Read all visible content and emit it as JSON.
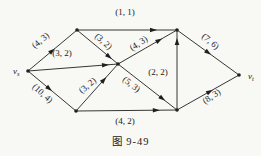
{
  "caption": "图 9-49",
  "colors": {
    "background": "#f8f8f5",
    "ink": "#1f1f1f"
  },
  "network": {
    "description": "flow-network-with-capacity-flow-labels",
    "nodes": [
      {
        "id": "vs",
        "x": 28,
        "y": 71,
        "label": "v",
        "sub": "s",
        "label_dx": -15,
        "label_dy": 1
      },
      {
        "id": "a",
        "x": 77,
        "y": 30
      },
      {
        "id": "b",
        "x": 177,
        "y": 30
      },
      {
        "id": "m",
        "x": 118,
        "y": 64
      },
      {
        "id": "c",
        "x": 76,
        "y": 111
      },
      {
        "id": "d",
        "x": 177,
        "y": 110
      },
      {
        "id": "vt",
        "x": 239,
        "y": 75,
        "label": "v",
        "sub": "t",
        "label_dx": 9,
        "label_dy": 2
      }
    ],
    "edges": [
      {
        "from": "vs",
        "to": "a",
        "label": "(4, 3)",
        "arrow_t": 0.55,
        "lx": 41,
        "ly": 41,
        "la": -40
      },
      {
        "from": "a",
        "to": "b",
        "label": "(1, 1)",
        "arrow_t": 0.8,
        "lx": 125,
        "ly": 13,
        "la": 0
      },
      {
        "from": "a",
        "to": "m",
        "label": "(3, 2)",
        "arrow_t": 0.85,
        "lx": 103,
        "ly": 42,
        "la": 42
      },
      {
        "from": "vs",
        "to": "m",
        "label": "(3, 2)",
        "arrow_t": 0.9,
        "lx": 62,
        "ly": 54,
        "la": 0
      },
      {
        "from": "vs",
        "to": "c",
        "label": "(10, 4)",
        "arrow_t": 0.5,
        "lx": 42,
        "ly": 94,
        "la": 42
      },
      {
        "from": "c",
        "to": "m",
        "label": "(3, 2)",
        "arrow_t": 0.72,
        "lx": 88,
        "ly": 86,
        "la": -40
      },
      {
        "from": "m",
        "to": "b",
        "label": "(4, 3)",
        "arrow_t": 0.75,
        "lx": 139,
        "ly": 44,
        "la": -33
      },
      {
        "from": "m",
        "to": "d",
        "label": "(5, 3)",
        "arrow_t": 0.8,
        "lx": 131,
        "ly": 85,
        "la": 38
      },
      {
        "from": "c",
        "to": "d",
        "label": "(4, 2)",
        "arrow_t": 0.83,
        "lx": 125,
        "ly": 122,
        "la": 0
      },
      {
        "from": "d",
        "to": "b",
        "label": "(2, 2)",
        "arrow_t": 0.9,
        "lx": 158,
        "ly": 73,
        "la": 0
      },
      {
        "from": "b",
        "to": "vt",
        "label": "(7, 6)",
        "arrow_t": 0.55,
        "lx": 210,
        "ly": 42,
        "la": 40
      },
      {
        "from": "d",
        "to": "vt",
        "label": "(8, 3)",
        "arrow_t": 0.58,
        "lx": 212,
        "ly": 97,
        "la": -34
      }
    ]
  }
}
